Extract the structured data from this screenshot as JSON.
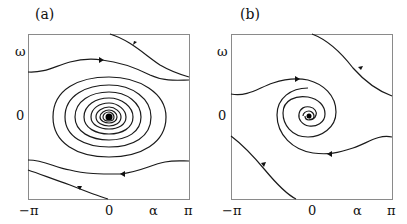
{
  "panels": [
    {
      "id": "a",
      "title": "(a)",
      "y_label": "ω",
      "y_tick_zero": "0",
      "x_ticks": [
        "−π",
        "0",
        "α",
        "π"
      ],
      "description": "Stable focus at origin with many tight spiral turns; trajectories above and below run left-to-right / right-to-left"
    },
    {
      "id": "b",
      "title": "(b)",
      "y_label": "ω",
      "y_tick_zero": "0",
      "x_ticks": [
        "−π",
        "0",
        "α",
        "π"
      ],
      "description": "Stable focus with faster-decaying spiral; outer trajectories wind into the focus"
    }
  ]
}
